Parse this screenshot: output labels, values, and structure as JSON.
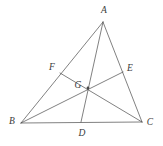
{
  "figure": {
    "kind": "geometry-diagram",
    "width": 163,
    "height": 146,
    "background_color": "#ffffff",
    "line_color": "#4a4a4a",
    "label_color": "#3a3a3a",
    "line_width": 0.7,
    "points": [
      {
        "id": "A",
        "label": "A",
        "x": 103,
        "y": 22,
        "label_x": 104,
        "label_y": 11,
        "marked": false
      },
      {
        "id": "B",
        "label": "B",
        "x": 21,
        "y": 123,
        "label_x": 12,
        "label_y": 122,
        "marked": false
      },
      {
        "id": "C",
        "label": "C",
        "x": 142,
        "y": 122,
        "label_x": 150,
        "label_y": 123,
        "marked": false
      },
      {
        "id": "D",
        "label": "D",
        "x": 81,
        "y": 122,
        "label_x": 82,
        "label_y": 134,
        "marked": false
      },
      {
        "id": "E",
        "label": "E",
        "x": 123,
        "y": 72,
        "label_x": 130,
        "label_y": 69,
        "marked": false
      },
      {
        "id": "F",
        "label": "F",
        "x": 60,
        "y": 73,
        "label_x": 52,
        "label_y": 68,
        "marked": false
      },
      {
        "id": "G",
        "label": "G",
        "x": 88,
        "y": 88,
        "label_x": 78,
        "label_y": 86,
        "marked": true
      }
    ],
    "segments": [
      {
        "id": "side-AB",
        "from": "A",
        "to": "B",
        "kind": "side"
      },
      {
        "id": "side-BC",
        "from": "B",
        "to": "C",
        "kind": "side"
      },
      {
        "id": "side-CA",
        "from": "C",
        "to": "A",
        "kind": "side"
      },
      {
        "id": "median-AD",
        "from": "A",
        "to": "D",
        "kind": "median"
      },
      {
        "id": "median-BE",
        "from": "B",
        "to": "E",
        "kind": "median"
      },
      {
        "id": "median-CF",
        "from": "C",
        "to": "F",
        "kind": "median"
      }
    ]
  }
}
